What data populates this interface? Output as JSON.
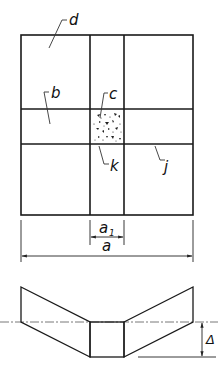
{
  "diagram": {
    "type": "technical-drawing",
    "plan_view": {
      "labels": {
        "d": "d",
        "b": "b",
        "c": "c",
        "k": "k",
        "j": "j"
      },
      "dimensions": {
        "a1": "a",
        "a1_subscript": "1",
        "a": "a"
      }
    },
    "section_view": {
      "dimension_delta": "Δ"
    },
    "colors": {
      "line": "#1a1a1a",
      "background": "#ffffff"
    }
  }
}
